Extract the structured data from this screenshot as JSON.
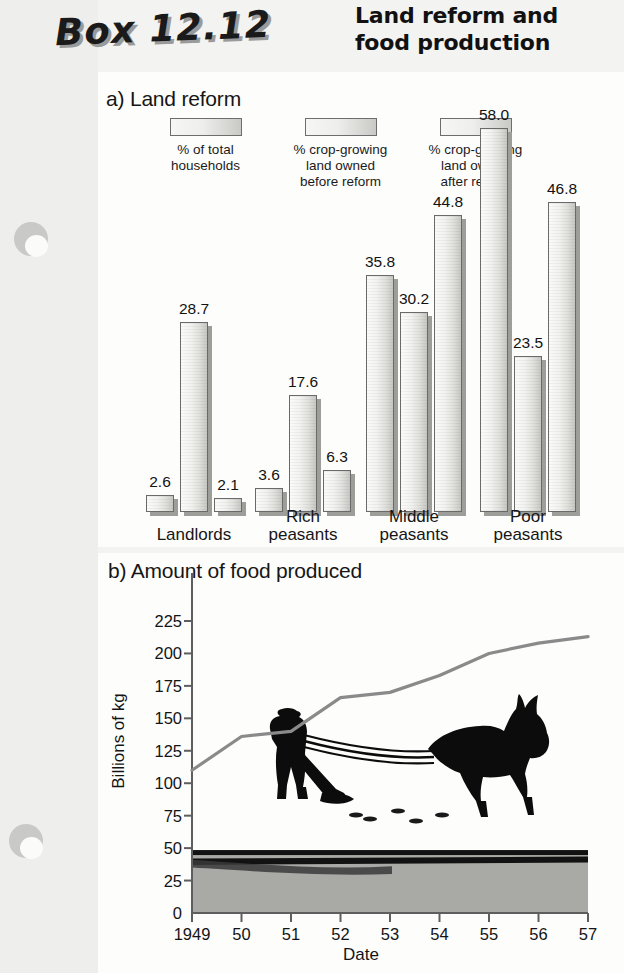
{
  "header": {
    "box_number": "Box 12.12",
    "title": "Land reform and food production"
  },
  "panel_a": {
    "title": "a) Land reform",
    "legend": [
      {
        "label": "% of total\nhouseholds",
        "swatch": "legend-swatch-households"
      },
      {
        "label": "% crop-growing\nland owned\nbefore reform",
        "swatch": "legend-swatch-before"
      },
      {
        "label": "% crop-growing\nland owned\nafter reform",
        "swatch": "legend-swatch-after"
      }
    ]
  },
  "panel_b": {
    "title": "b) Amount of food produced"
  },
  "chart_data": [
    {
      "type": "bar",
      "title": "a) Land reform",
      "xlabel": "",
      "ylabel": "",
      "ylim": [
        0,
        58
      ],
      "grid": false,
      "legend_position": "top",
      "categories": [
        "Landlords",
        "Rich\npeasants",
        "Middle\npeasants",
        "Poor\npeasants"
      ],
      "series": [
        {
          "name": "% of total households",
          "values": [
            2.6,
            3.6,
            35.8,
            58.0
          ]
        },
        {
          "name": "% crop-growing land owned before reform",
          "values": [
            28.7,
            17.6,
            30.2,
            23.5
          ]
        },
        {
          "name": "% crop-growing land owned after reform",
          "values": [
            2.1,
            6.3,
            44.8,
            46.8
          ]
        }
      ],
      "value_labels": [
        "2.6",
        "28.7",
        "2.1",
        "3.6",
        "17.6",
        "6.3",
        "35.8",
        "30.2",
        "44.8",
        "58.0",
        "23.5",
        "46.8"
      ]
    },
    {
      "type": "line",
      "title": "b) Amount of food produced",
      "xlabel": "Date",
      "ylabel": "Billions of kg",
      "xlim": [
        1949,
        1957
      ],
      "ylim": [
        0,
        225
      ],
      "grid": false,
      "legend_position": "none",
      "x": [
        1949,
        1950,
        1951,
        1952,
        1953,
        1954,
        1955,
        1956,
        1957
      ],
      "xtick_labels": [
        "1949",
        "50",
        "51",
        "52",
        "53",
        "54",
        "55",
        "56",
        "57"
      ],
      "ytick_labels": [
        "0",
        "25",
        "50",
        "75",
        "100",
        "125",
        "150",
        "175",
        "200",
        "225"
      ],
      "ytick_values": [
        0,
        25,
        50,
        75,
        100,
        125,
        150,
        175,
        200,
        225
      ],
      "series": [
        {
          "name": "Food produced",
          "values": [
            110,
            136,
            140,
            166,
            170,
            183,
            200,
            208,
            213
          ]
        }
      ]
    }
  ],
  "colors": {
    "paper": "#f3f3f1",
    "panel": "#fdfdfc",
    "bar_outline": "#6a6a6a",
    "bar_shadow": "#9d9d9a",
    "line": "#8a8a8a",
    "ink": "#161616",
    "field": "#a9a9a6"
  }
}
